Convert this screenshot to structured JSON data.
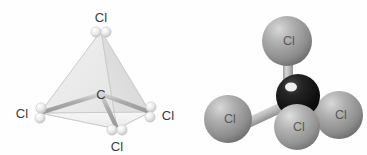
{
  "figure": {
    "background_color": "#fefefe",
    "panels": [
      {
        "id": "tetrahedron",
        "name": "ball-and-stick tetrahedral model",
        "center_atom": {
          "label": "C",
          "x": 101,
          "y": 94,
          "color": "#cfcfcf"
        },
        "vertex_atoms": [
          {
            "label": "Cl",
            "position": "top",
            "ball_x": 101,
            "ball_y": 31,
            "label_x": 101,
            "label_y": 17,
            "color": "#e4e4e4"
          },
          {
            "label": "Cl",
            "position": "left",
            "ball_x": 40,
            "ball_y": 113,
            "label_x": 23,
            "label_y": 113,
            "color": "#e4e4e4"
          },
          {
            "label": "Cl",
            "position": "right",
            "ball_x": 150,
            "ball_y": 112,
            "label_x": 166,
            "label_y": 115,
            "color": "#e4e4e4"
          },
          {
            "label": "Cl",
            "position": "bottom",
            "ball_x": 117,
            "ball_y": 129,
            "label_x": 117,
            "label_y": 148,
            "color": "#e4e4e4"
          }
        ],
        "face_colors": {
          "left_face": "#ededed",
          "right_face": "#dcdcdc",
          "bottom_face": "#f4f4f4"
        },
        "bond_color": "#b9b9b9",
        "edge_color": "#c6c6c6"
      },
      {
        "id": "spacefill",
        "name": "space-filling ball-and-stick model",
        "center_atom": {
          "label": "C",
          "x": 298,
          "y": 96,
          "radius": 22,
          "color": "#171717"
        },
        "bonded_atoms": [
          {
            "label": "Cl",
            "position": "top",
            "x": 287,
            "y": 41,
            "radius": 25,
            "color": "#9e9e9e"
          },
          {
            "label": "Cl",
            "position": "left-front",
            "x": 228,
            "y": 119,
            "radius": 24,
            "color": "#9e9e9e"
          },
          {
            "label": "Cl",
            "position": "right-front",
            "x": 339,
            "y": 115,
            "radius": 24,
            "color": "#9e9e9e"
          },
          {
            "label": "Cl",
            "position": "bottom-front",
            "x": 297,
            "y": 127,
            "radius": 23,
            "color": "#a6a6a6"
          }
        ],
        "bond_color": "#bcbcbc"
      }
    ]
  }
}
